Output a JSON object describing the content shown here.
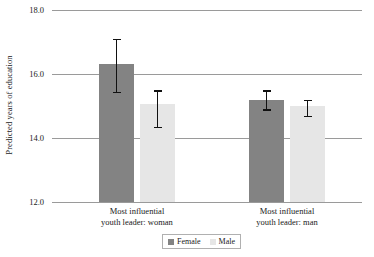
{
  "chart_data": {
    "type": "bar",
    "title": "",
    "subtitle": "",
    "xlabel": "",
    "ylabel": "Predicted years of education",
    "ylim": [
      12.0,
      18.0
    ],
    "yticks": [
      "18.0",
      "16.0",
      "14.0",
      "12.0"
    ],
    "ytick_values": [
      18.0,
      16.0,
      14.0,
      12.0
    ],
    "grid": true,
    "grid_axis": "y",
    "legend_position": "bottom-center",
    "categories": [
      "Most influential youth leader: woman",
      "Most influential youth leader: man"
    ],
    "category_lines": [
      [
        "Most influential",
        "youth leader: woman"
      ],
      [
        "Most influential",
        "youth leader: man"
      ]
    ],
    "series": [
      {
        "name": "Female",
        "color": "#838383",
        "values": [
          16.3,
          15.2
        ],
        "error_low": [
          15.4,
          14.85
        ],
        "error_high": [
          17.1,
          15.5
        ]
      },
      {
        "name": "Male",
        "color": "#e6e6e6",
        "values": [
          15.05,
          15.0
        ],
        "error_low": [
          14.3,
          14.65
        ],
        "error_high": [
          15.5,
          15.2
        ]
      }
    ]
  },
  "legend": {
    "items": [
      {
        "label": "Female",
        "swatch": "female"
      },
      {
        "label": "Male",
        "swatch": "male"
      }
    ]
  },
  "colors": {
    "female_bar": "#838383",
    "male_bar": "#e6e6e6",
    "gridline": "#9a9a9a",
    "errorbar": "#111111",
    "text": "#1a1a1a",
    "background": "#ffffff"
  }
}
